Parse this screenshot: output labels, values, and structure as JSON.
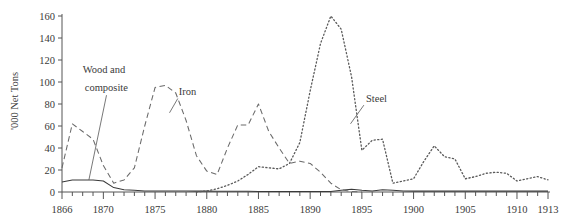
{
  "chart_data": {
    "type": "line",
    "title": "",
    "xlabel": "",
    "ylabel": "'000 Net Tons",
    "xlim": [
      1866,
      1913
    ],
    "ylim": [
      0,
      160
    ],
    "grid": false,
    "legend_position": "inline-annotations",
    "y_ticks": [
      0,
      20,
      40,
      60,
      80,
      100,
      120,
      140,
      160
    ],
    "x_ticks": [
      1866,
      1867,
      1868,
      1869,
      1870,
      1871,
      1872,
      1873,
      1874,
      1875,
      1876,
      1877,
      1878,
      1879,
      1880,
      1881,
      1882,
      1883,
      1884,
      1885,
      1886,
      1887,
      1888,
      1889,
      1890,
      1891,
      1892,
      1893,
      1894,
      1895,
      1896,
      1897,
      1898,
      1899,
      1900,
      1901,
      1902,
      1903,
      1904,
      1905,
      1906,
      1907,
      1908,
      1909,
      1910,
      1911,
      1912,
      1913
    ],
    "x_tick_labels": [
      "1866",
      "1870",
      "1875",
      "1880",
      "1885",
      "1890",
      "1895",
      "1900",
      "1905",
      "1910",
      "1913"
    ],
    "x_tick_label_years": [
      1866,
      1870,
      1875,
      1880,
      1885,
      1890,
      1895,
      1900,
      1905,
      1910,
      1913
    ],
    "annotations": [
      {
        "text": "Wood and",
        "year": 1868.0,
        "value": 108
      },
      {
        "text": "composite",
        "year": 1868.2,
        "value": 92
      },
      {
        "text": "Iron",
        "year": 1877.3,
        "value": 88
      },
      {
        "text": "Steel",
        "year": 1895.4,
        "value": 82
      }
    ],
    "series": [
      {
        "name": "Wood and composite",
        "style": "solid",
        "color": "#3a3a3a",
        "x": [
          1866,
          1867,
          1868,
          1869,
          1870,
          1871,
          1872,
          1873,
          1874,
          1875,
          1876,
          1877,
          1878,
          1879,
          1880,
          1881,
          1882,
          1883,
          1884,
          1885,
          1886,
          1887,
          1888,
          1889,
          1890,
          1891,
          1892,
          1893,
          1894,
          1895,
          1896,
          1897,
          1898,
          1899,
          1900,
          1901,
          1902,
          1903,
          1904,
          1905,
          1906,
          1907,
          1908,
          1909,
          1910,
          1911,
          1912,
          1913
        ],
        "values": [
          9,
          11,
          11,
          11,
          10,
          4,
          2,
          1.5,
          1,
          1,
          1,
          1,
          1,
          0.8,
          0.8,
          0.7,
          0.7,
          0.6,
          0.6,
          0.5,
          0.5,
          0.5,
          0.5,
          0.4,
          0.4,
          0.4,
          0.4,
          1.5,
          2.5,
          1.5,
          1,
          2,
          1.5,
          1,
          0.8,
          0.8,
          0.8,
          0.8,
          0.8,
          0.8,
          0.8,
          0.8,
          0.8,
          0.8,
          0.8,
          0.8,
          0.8,
          0.8
        ]
      },
      {
        "name": "Iron",
        "style": "dashed",
        "color": "#6a6a6a",
        "x": [
          1866,
          1867,
          1868,
          1869,
          1870,
          1871,
          1872,
          1873,
          1874,
          1875,
          1876,
          1877,
          1878,
          1879,
          1880,
          1881,
          1882,
          1883,
          1884,
          1885,
          1886,
          1887,
          1888,
          1889,
          1890,
          1891,
          1892,
          1893,
          1894,
          1895
        ],
        "values": [
          22,
          62,
          55,
          48,
          24,
          8,
          11,
          22,
          60,
          95,
          97,
          90,
          65,
          33,
          19,
          16,
          40,
          61,
          61,
          80,
          55,
          40,
          26,
          28,
          26,
          18,
          8,
          2,
          0.5,
          0
        ]
      },
      {
        "name": "Steel",
        "style": "dotted",
        "color": "#5a5a5a",
        "x": [
          1879,
          1880,
          1881,
          1882,
          1883,
          1884,
          1885,
          1886,
          1887,
          1888,
          1889,
          1890,
          1891,
          1892,
          1893,
          1894,
          1895,
          1896,
          1897,
          1898,
          1899,
          1900,
          1901,
          1902,
          1903,
          1904,
          1905,
          1906,
          1907,
          1908,
          1909,
          1910,
          1911,
          1912,
          1913
        ],
        "values": [
          0,
          1,
          3,
          6,
          10,
          16,
          23,
          22,
          21,
          26,
          45,
          92,
          135,
          160,
          148,
          105,
          38,
          47,
          48,
          8,
          10,
          12,
          28,
          42,
          32,
          30,
          12,
          14,
          17,
          18,
          17,
          10,
          12,
          14,
          11
        ]
      }
    ]
  }
}
